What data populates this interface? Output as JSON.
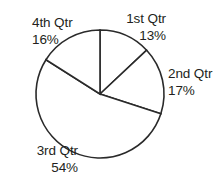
{
  "chart_data": {
    "type": "pie",
    "title": "",
    "subtitle": "",
    "xlabel": "",
    "ylabel": "",
    "legend_position": "none",
    "grid": false,
    "start_angle_deg": 0,
    "direction": "clockwise",
    "labels_outside": true,
    "leader_lines": false,
    "categories": [
      "1st Qtr",
      "2nd Qtr",
      "3rd Qtr",
      "4th Qtr"
    ],
    "values": [
      13,
      17,
      54,
      16
    ],
    "value_suffix": "%",
    "slices": [
      {
        "name": "1st Qtr",
        "value": 13,
        "value_label": "13%",
        "start_deg": 0.0,
        "end_deg": 46.8,
        "fill": "#ffffff",
        "stroke": "#2a2a2a"
      },
      {
        "name": "2nd Qtr",
        "value": 17,
        "value_label": "17%",
        "start_deg": 46.8,
        "end_deg": 108.0,
        "fill": "#ffffff",
        "stroke": "#2a2a2a"
      },
      {
        "name": "3rd Qtr",
        "value": 54,
        "value_label": "54%",
        "start_deg": 108.0,
        "end_deg": 302.4,
        "fill": "#ffffff",
        "stroke": "#2a2a2a"
      },
      {
        "name": "4th Qtr",
        "value": 16,
        "value_label": "16%",
        "start_deg": 302.4,
        "end_deg": 360.0,
        "fill": "#ffffff",
        "stroke": "#2a2a2a"
      }
    ],
    "geometry": {
      "center_x": 100,
      "center_y": 94,
      "radius": 64
    },
    "colors": {
      "background": "#ffffff",
      "outline": "#2a2a2a",
      "text": "#231f20"
    }
  }
}
